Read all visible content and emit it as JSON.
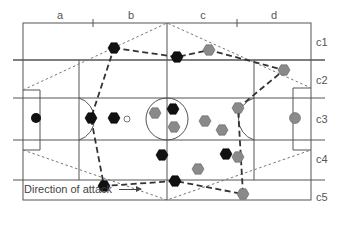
{
  "columns": [
    {
      "label": "a",
      "x": 60
    },
    {
      "label": "b",
      "x": 131
    },
    {
      "label": "c",
      "x": 203
    },
    {
      "label": "d",
      "x": 274
    }
  ],
  "rows": [
    {
      "label": "c1",
      "y": 42
    },
    {
      "label": "c2",
      "y": 80
    },
    {
      "label": "c3",
      "y": 119
    },
    {
      "label": "c4",
      "y": 159
    },
    {
      "label": "c5",
      "y": 197
    }
  ],
  "annotation": {
    "text": "Direction of attack",
    "arrow": "right-arrow"
  },
  "colors": {
    "line": "#555555",
    "team_dark": "#111111",
    "team_gray": "#8a8a8a",
    "dotted": "#777777"
  },
  "players": {
    "dark_team": [
      {
        "x": 114,
        "y": 48
      },
      {
        "x": 177,
        "y": 57
      },
      {
        "x": 91,
        "y": 118
      },
      {
        "x": 114,
        "y": 118
      },
      {
        "x": 173,
        "y": 109
      },
      {
        "x": 162,
        "y": 155
      },
      {
        "x": 175,
        "y": 181
      },
      {
        "x": 104,
        "y": 186
      },
      {
        "x": 226,
        "y": 154
      }
    ],
    "dark_goalkeeper": {
      "x": 36,
      "y": 118
    },
    "gray_team": [
      {
        "x": 209,
        "y": 50
      },
      {
        "x": 284,
        "y": 70
      },
      {
        "x": 238,
        "y": 108
      },
      {
        "x": 155,
        "y": 113
      },
      {
        "x": 174,
        "y": 127
      },
      {
        "x": 205,
        "y": 121
      },
      {
        "x": 222,
        "y": 130
      },
      {
        "x": 238,
        "y": 157
      },
      {
        "x": 198,
        "y": 169
      },
      {
        "x": 243,
        "y": 194
      }
    ],
    "gray_goalkeeper": {
      "x": 295,
      "y": 118
    },
    "ball": {
      "x": 127,
      "y": 119
    }
  },
  "team_shape_path": [
    [
      114,
      48
    ],
    [
      177,
      57
    ],
    [
      209,
      50
    ],
    [
      284,
      70
    ],
    [
      238,
      108
    ],
    [
      243,
      194
    ],
    [
      175,
      181
    ],
    [
      104,
      186
    ],
    [
      91,
      118
    ],
    [
      114,
      48
    ]
  ],
  "dotted_wedges": [
    [
      [
        23,
        90
      ],
      [
        167,
        23
      ],
      [
        311,
        88
      ]
    ],
    [
      [
        23,
        150
      ],
      [
        167,
        200
      ],
      [
        311,
        150
      ]
    ]
  ]
}
